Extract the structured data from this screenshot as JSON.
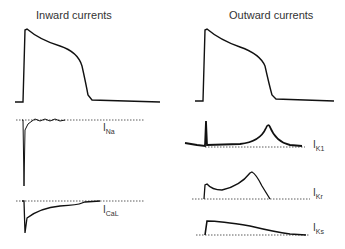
{
  "titles": {
    "left": "Inward currents",
    "right": "Outward currents"
  },
  "labels": {
    "ina": {
      "main": "I",
      "sub": "Na"
    },
    "ical": {
      "main": "I",
      "sub": "CaL"
    },
    "ik1": {
      "main": "I",
      "sub": "K1"
    },
    "ikr": {
      "main": "I",
      "sub": "Kr"
    },
    "iks": {
      "main": "I",
      "sub": "Ks"
    }
  },
  "colors": {
    "trace": "#111111",
    "baseline": "#333333"
  }
}
